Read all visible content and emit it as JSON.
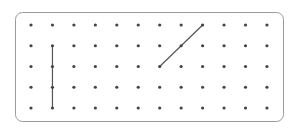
{
  "board": {
    "frame": {
      "x": 15.5,
      "y": 12.5,
      "width": 268,
      "height": 109,
      "radius": 7,
      "stroke": "#9a9a9a"
    },
    "grid": {
      "columns": 12,
      "rows": 5,
      "x_start": 31,
      "x_step": 21.45,
      "y_start": 25,
      "y_step": 20.75,
      "dot_radius": 1.6,
      "dot_color": "#444444"
    },
    "segments": [
      {
        "name": "vertical-segment",
        "from": [
          1,
          1
        ],
        "to": [
          1,
          4
        ],
        "color": "#555555"
      },
      {
        "name": "diagonal-segment",
        "from": [
          6,
          2
        ],
        "to": [
          8,
          0
        ],
        "color": "#555555"
      }
    ]
  }
}
